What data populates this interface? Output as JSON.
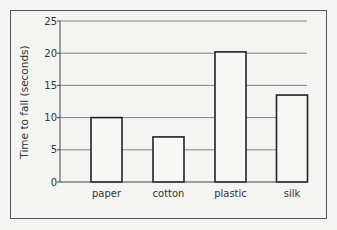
{
  "chart_data": {
    "type": "bar",
    "title": "",
    "xlabel": "",
    "ylabel": "Time to fall (seconds)",
    "categories": [
      "paper",
      "cotton",
      "plastic",
      "silk"
    ],
    "values": [
      10,
      7,
      20.2,
      13.5
    ],
    "ylim": [
      0,
      25
    ],
    "yticks": [
      0,
      5,
      10,
      15,
      20,
      25
    ],
    "grid": true,
    "legend": null
  }
}
